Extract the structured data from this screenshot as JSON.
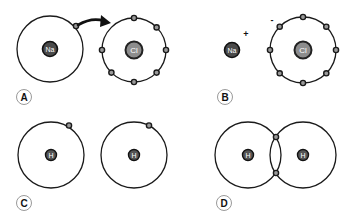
{
  "panels": {
    "A": {
      "label": "A",
      "description": "Sodium atom transferring its outer electron to a chlorine atom",
      "atom1": {
        "symbol": "Na"
      },
      "atom2": {
        "symbol": "Cl"
      }
    },
    "B": {
      "label": "B",
      "description": "Resulting sodium cation and chloride anion",
      "ion1": {
        "symbol": "Na",
        "charge": "+"
      },
      "ion2": {
        "symbol": "Cl",
        "charge": "-"
      }
    },
    "C": {
      "label": "C",
      "description": "Two separate hydrogen atoms, each with one electron",
      "atom1": {
        "symbol": "H"
      },
      "atom2": {
        "symbol": "H"
      }
    },
    "D": {
      "label": "D",
      "description": "Two hydrogen atoms sharing an electron pair (covalent bond)",
      "atom1": {
        "symbol": "H"
      },
      "atom2": {
        "symbol": "H"
      }
    }
  },
  "colors": {
    "line": "#1a1a1a",
    "nucleus_dark": "#4a4a4a",
    "nucleus_cl": "#8d8d8d",
    "label_border": "#9a9a9a"
  }
}
